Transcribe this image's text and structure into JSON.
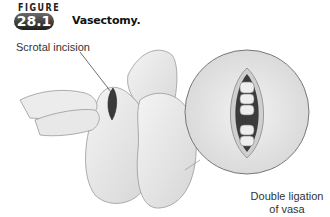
{
  "figure": {
    "label": "FIGURE",
    "number": "28.1",
    "title": "Vasectomy."
  },
  "callouts": {
    "incision": "Scrotal incision",
    "ligation_line1": "Double ligation",
    "ligation_line2": "of vasa"
  },
  "colors": {
    "badge": "#3a3a3a",
    "skin": "#e6e6e6",
    "outline": "#8a8a8a"
  }
}
